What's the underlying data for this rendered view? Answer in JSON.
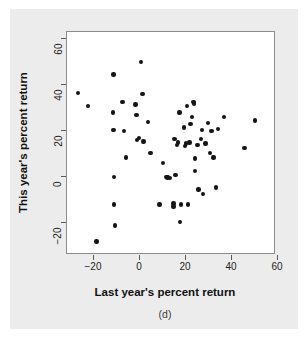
{
  "figure": {
    "caption": "(d)",
    "background_color": "#ececec",
    "panel_color": "#ffffff",
    "point_color": "#151515"
  },
  "chart_data": {
    "type": "scatter",
    "title": "",
    "xlabel": "Last year's percent return",
    "ylabel": "This year's percent return",
    "xlim": [
      -33,
      66
    ],
    "ylim": [
      -31,
      66
    ],
    "xticks": [
      -20,
      0,
      20,
      40,
      60
    ],
    "yticks": [
      -20,
      0,
      20,
      40,
      60
    ],
    "xticklabels": [
      "−20",
      "0",
      "20",
      "40",
      "60"
    ],
    "yticklabels": [
      "−20",
      "0",
      "20",
      "40",
      "60"
    ],
    "grid": false,
    "legend": null,
    "n_points": 62,
    "points": [
      [
        -27.0,
        36.5
      ],
      [
        -22.6,
        31.0
      ],
      [
        -19.0,
        -28.0
      ],
      [
        -11.5,
        44.5
      ],
      [
        -11.8,
        28.0
      ],
      [
        -11.5,
        20.5
      ],
      [
        -11.3,
        0.0
      ],
      [
        -11.3,
        -12.0
      ],
      [
        -11.0,
        -21.0
      ],
      [
        -7.6,
        32.5
      ],
      [
        -7.0,
        20.0
      ],
      [
        -6.0,
        8.5
      ],
      [
        -2.0,
        31.5
      ],
      [
        -1.6,
        27.0
      ],
      [
        -1.2,
        16.0
      ],
      [
        -0.5,
        17.0
      ],
      [
        0.4,
        50.0
      ],
      [
        1.0,
        36.0
      ],
      [
        1.5,
        15.5
      ],
      [
        3.5,
        24.0
      ],
      [
        4.5,
        10.5
      ],
      [
        8.5,
        -12.0
      ],
      [
        10.0,
        6.0
      ],
      [
        11.5,
        0.0
      ],
      [
        13.0,
        -0.5
      ],
      [
        14.5,
        -11.5
      ],
      [
        14.6,
        -12.8
      ],
      [
        15.0,
        16.5
      ],
      [
        15.5,
        1.0
      ],
      [
        16.5,
        15.0
      ],
      [
        17.2,
        28.0
      ],
      [
        17.5,
        -19.5
      ],
      [
        17.8,
        -12.0
      ],
      [
        19.0,
        21.5
      ],
      [
        19.5,
        13.5
      ],
      [
        20.0,
        14.5
      ],
      [
        20.5,
        31.0
      ],
      [
        20.8,
        -12.0
      ],
      [
        22.0,
        23.0
      ],
      [
        22.5,
        26.0
      ],
      [
        23.2,
        32.5
      ],
      [
        23.5,
        32.0
      ],
      [
        23.8,
        8.0
      ],
      [
        24.0,
        2.5
      ],
      [
        25.0,
        14.0
      ],
      [
        25.5,
        -5.5
      ],
      [
        26.5,
        16.5
      ],
      [
        27.0,
        20.5
      ],
      [
        27.5,
        -7.5
      ],
      [
        28.5,
        14.5
      ],
      [
        29.5,
        23.5
      ],
      [
        30.5,
        10.5
      ],
      [
        31.0,
        20.0
      ],
      [
        32.0,
        8.5
      ],
      [
        33.0,
        -4.5
      ],
      [
        34.0,
        21.0
      ],
      [
        36.5,
        26.0
      ],
      [
        45.5,
        12.5
      ],
      [
        50.0,
        24.5
      ],
      [
        16.0,
        14.0
      ],
      [
        21.5,
        15.0
      ],
      [
        12.0,
        -0.2
      ]
    ]
  }
}
